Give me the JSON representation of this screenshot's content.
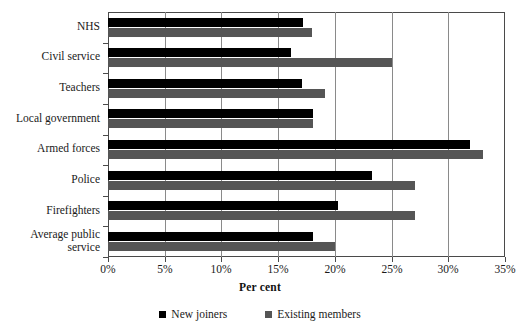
{
  "chart_data": {
    "type": "bar",
    "orientation": "horizontal",
    "title": "",
    "xlabel": "Per cent",
    "ylabel": "",
    "xlim": [
      0,
      35
    ],
    "xticks": [
      "0%",
      "5%",
      "10%",
      "15%",
      "20%",
      "25%",
      "30%",
      "35%"
    ],
    "xtick_values": [
      0,
      5,
      10,
      15,
      20,
      25,
      30,
      35
    ],
    "grid": true,
    "grid_axis": "x",
    "legend_position": "bottom",
    "categories": [
      "NHS",
      "Civil service",
      "Teachers",
      "Local government",
      "Armed forces",
      "Police",
      "Firefighters",
      "Average public service"
    ],
    "series": [
      {
        "name": "New joiners",
        "color": "#000000",
        "values": [
          17.2,
          16.1,
          17.1,
          18.1,
          31.9,
          23.3,
          20.3,
          18.1
        ]
      },
      {
        "name": "Existing members",
        "color": "#555555",
        "values": [
          18.0,
          25.0,
          19.1,
          18.1,
          33.1,
          27.1,
          27.1,
          20.0
        ]
      }
    ]
  },
  "axis": {
    "x_title": "Per cent"
  },
  "colors": {
    "new_joiners": "#000000",
    "existing_members": "#555555",
    "frame": "#4a4a4a",
    "gridline": "#8a8a8a",
    "background": "#ffffff"
  }
}
